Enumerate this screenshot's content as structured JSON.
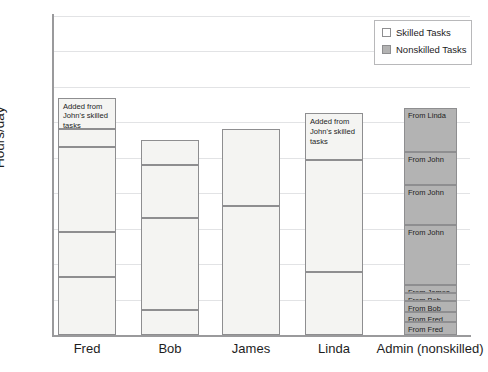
{
  "chart_data": {
    "type": "bar",
    "title": "",
    "xlabel": "",
    "ylabel": "Hours/day",
    "ylim": [
      0,
      9
    ],
    "yticks": [
      0,
      1,
      2,
      3,
      4,
      5,
      6,
      7,
      8,
      9
    ],
    "grid": true,
    "stacked": true,
    "legend_position": "top-right",
    "categories": [
      "Fred",
      "Bob",
      "James",
      "Linda",
      "Admin (nonskilled)"
    ],
    "legend": [
      {
        "label": "Skilled Tasks",
        "color": "#f4f4f2"
      },
      {
        "label": "Nonskilled Tasks",
        "color": "#b3b3b3"
      }
    ],
    "bars": [
      {
        "category": "Fred",
        "total": 6.7,
        "segments": [
          {
            "from": 0.0,
            "to": 1.65,
            "type": "skilled",
            "label": ""
          },
          {
            "from": 1.65,
            "to": 2.9,
            "type": "skilled",
            "label": ""
          },
          {
            "from": 2.9,
            "to": 5.3,
            "type": "skilled",
            "label": ""
          },
          {
            "from": 5.3,
            "to": 5.8,
            "type": "skilled",
            "label": ""
          },
          {
            "from": 5.8,
            "to": 6.7,
            "type": "skilled",
            "label": "Added from John's skilled tasks"
          }
        ]
      },
      {
        "category": "Bob",
        "total": 5.5,
        "segments": [
          {
            "from": 0.0,
            "to": 0.7,
            "type": "skilled",
            "label": ""
          },
          {
            "from": 0.7,
            "to": 3.3,
            "type": "skilled",
            "label": ""
          },
          {
            "from": 3.3,
            "to": 4.8,
            "type": "skilled",
            "label": ""
          },
          {
            "from": 4.8,
            "to": 5.5,
            "type": "skilled",
            "label": ""
          }
        ]
      },
      {
        "category": "James",
        "total": 5.8,
        "segments": [
          {
            "from": 0.0,
            "to": 3.63,
            "type": "skilled",
            "label": ""
          },
          {
            "from": 3.63,
            "to": 5.8,
            "type": "skilled",
            "label": ""
          }
        ]
      },
      {
        "category": "Linda",
        "total": 6.25,
        "segments": [
          {
            "from": 0.0,
            "to": 1.78,
            "type": "skilled",
            "label": ""
          },
          {
            "from": 1.78,
            "to": 4.93,
            "type": "skilled",
            "label": ""
          },
          {
            "from": 4.93,
            "to": 6.25,
            "type": "skilled",
            "label": "Added from John's skilled tasks"
          }
        ]
      },
      {
        "category": "Admin (nonskilled)",
        "total": 6.4,
        "segments": [
          {
            "from": 0.0,
            "to": 0.37,
            "type": "nonskilled",
            "label": "From Fred"
          },
          {
            "from": 0.37,
            "to": 0.66,
            "type": "nonskilled",
            "label": "From Fred"
          },
          {
            "from": 0.66,
            "to": 0.95,
            "type": "nonskilled",
            "label": "From Bob"
          },
          {
            "from": 0.95,
            "to": 1.18,
            "type": "nonskilled",
            "label": "From Bob"
          },
          {
            "from": 1.18,
            "to": 1.41,
            "type": "nonskilled",
            "label": "From James"
          },
          {
            "from": 1.41,
            "to": 3.1,
            "type": "nonskilled",
            "label": "From John"
          },
          {
            "from": 3.1,
            "to": 4.24,
            "type": "nonskilled",
            "label": "From John"
          },
          {
            "from": 4.24,
            "to": 5.17,
            "type": "nonskilled",
            "label": "From John"
          },
          {
            "from": 5.17,
            "to": 6.4,
            "type": "nonskilled",
            "label": "From Linda"
          }
        ]
      }
    ]
  }
}
